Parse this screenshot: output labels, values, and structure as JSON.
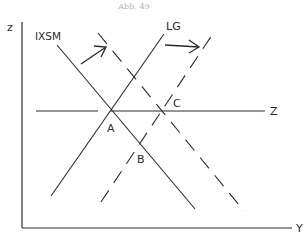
{
  "title": "Abb. 49",
  "axes": {
    "y_label": "z",
    "x_label": "Y"
  },
  "curves": {
    "ixsm": "IXSM",
    "lg": "LG",
    "z_line": "Z"
  },
  "points": {
    "a": "A",
    "b": "B",
    "c": "C"
  },
  "colors": {
    "ink": "#2a2a2a",
    "background": "#ffffff",
    "title": "#b5b5b5"
  }
}
